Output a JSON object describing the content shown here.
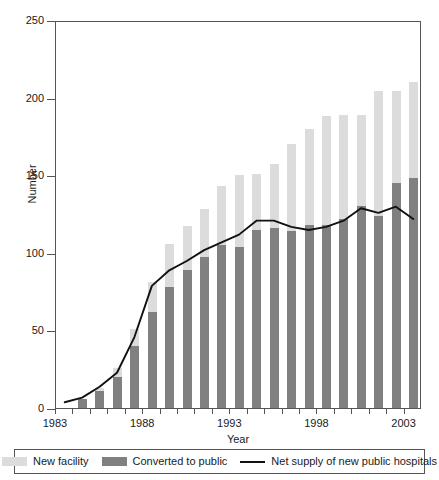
{
  "chart_data": {
    "type": "bar",
    "title": "",
    "subtitle": "",
    "xlabel": "Year",
    "ylabel": "Number",
    "ylim": [
      0,
      250
    ],
    "yticks": [
      0,
      50,
      100,
      150,
      200,
      250
    ],
    "xlim": [
      1983,
      2003
    ],
    "grid": false,
    "legend_position": "bottom",
    "stacked": true,
    "categories": [
      1983,
      1984,
      1985,
      1986,
      1987,
      1988,
      1989,
      1990,
      1991,
      1992,
      1993,
      1994,
      1995,
      1996,
      1997,
      1998,
      1999,
      2000,
      2001,
      2002,
      2003
    ],
    "tick_labels": [
      "1983",
      "",
      "",
      "",
      "",
      "1988",
      "",
      "",
      "",
      "",
      "1993",
      "",
      "",
      "",
      "",
      "1998",
      "",
      "",
      "",
      "",
      "2003"
    ],
    "series": [
      {
        "name": "Converted to public",
        "color": "#808080",
        "type": "bar-segment",
        "values": [
          0,
          6,
          11,
          20,
          40,
          62,
          78,
          89,
          97,
          105,
          104,
          115,
          116,
          114,
          118,
          118,
          122,
          130,
          124,
          145,
          148
        ]
      },
      {
        "name": "New facility",
        "color": "#dcdcdc",
        "type": "bar-segment",
        "values": [
          0,
          0,
          2,
          6,
          11,
          19,
          28,
          28,
          31,
          38,
          46,
          36,
          41,
          56,
          62,
          70,
          67,
          59,
          80,
          59,
          62
        ]
      },
      {
        "name": "Net supply of new public hospitals",
        "color": "#111111",
        "type": "line",
        "values": [
          5,
          8,
          15,
          24,
          47,
          80,
          90,
          96,
          103,
          108,
          113,
          122,
          122,
          118,
          116,
          118,
          122,
          130,
          127,
          131,
          123
        ]
      }
    ],
    "totals": [
      0,
      6,
      13,
      26,
      51,
      81,
      106,
      117,
      128,
      143,
      150,
      151,
      157,
      170,
      180,
      188,
      189,
      189,
      204,
      204,
      210
    ],
    "legend": [
      {
        "label": "New facility",
        "marker": "light-swatch",
        "color": "#dcdcdc"
      },
      {
        "label": "Converted to public",
        "marker": "dark-swatch",
        "color": "#808080"
      },
      {
        "label": "Net supply of new public hospitals",
        "marker": "line",
        "color": "#111111"
      }
    ]
  }
}
